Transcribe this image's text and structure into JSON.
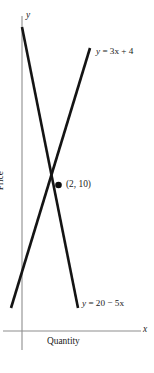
{
  "figure": {
    "type": "line-graph",
    "background_color": "#ffffff",
    "axis_color": "#8e8e8e",
    "curve_color": "#141414"
  },
  "axes": {
    "x": {
      "name": "Quantity",
      "variable": "x",
      "arrow": false
    },
    "y": {
      "name": "Price",
      "variable": "y",
      "arrow": false
    }
  },
  "labels": {
    "supply_equation": "y = 3x + 4",
    "demand_equation": "y = 20 − 5x",
    "intersection": "(2, 10)"
  },
  "chart_data": {
    "type": "line",
    "title": "",
    "xlabel": "Quantity",
    "ylabel": "Price",
    "xlim": [
      0,
      4.2
    ],
    "ylim": [
      0,
      24
    ],
    "grid": false,
    "legend": "inline-labels",
    "series": [
      {
        "name": "y = 3x + 4",
        "equation": "y = 3x + 4",
        "slope": 3,
        "intercept": 4,
        "points": [
          [
            -0.4,
            2.8
          ],
          [
            3.6,
            14.8
          ]
        ],
        "label_text": "y = 3x + 4"
      },
      {
        "name": "y = 20 − 5x",
        "equation": "y = 20 − 5x",
        "slope": -5,
        "intercept": 20,
        "points": [
          [
            0.0,
            23.0
          ],
          [
            2.85,
            5.8
          ]
        ],
        "label_text": "y = 20 − 5x"
      }
    ],
    "annotations": [
      {
        "text": "(2, 10)",
        "x": 2,
        "y": 10,
        "marker": "filled-circle"
      }
    ]
  }
}
